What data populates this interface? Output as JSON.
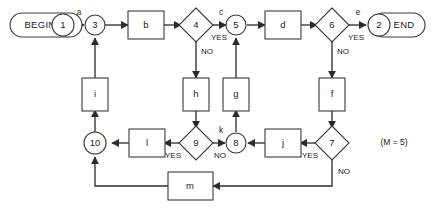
{
  "diagram": {
    "annotation": "(M = 5)",
    "terminators": [
      {
        "id": "begin",
        "label": "BEGIN",
        "node": "1"
      },
      {
        "id": "end",
        "label": "END",
        "node": "2"
      }
    ],
    "nodes": [
      {
        "id": "n1",
        "label": "1"
      },
      {
        "id": "n2",
        "label": "2"
      },
      {
        "id": "n3",
        "label": "3"
      },
      {
        "id": "n5",
        "label": "5"
      },
      {
        "id": "n8",
        "label": "8"
      },
      {
        "id": "n10",
        "label": "10"
      }
    ],
    "decisions": [
      {
        "id": "d4",
        "label": "4"
      },
      {
        "id": "d6",
        "label": "6"
      },
      {
        "id": "d7",
        "label": "7"
      },
      {
        "id": "d9",
        "label": "9"
      }
    ],
    "processes": [
      {
        "id": "pb",
        "label": "b"
      },
      {
        "id": "pd",
        "label": "d"
      },
      {
        "id": "pi",
        "label": "i"
      },
      {
        "id": "ph",
        "label": "h"
      },
      {
        "id": "pg",
        "label": "g"
      },
      {
        "id": "pf",
        "label": "f"
      },
      {
        "id": "pl",
        "label": "l"
      },
      {
        "id": "pj",
        "label": "j"
      },
      {
        "id": "pm",
        "label": "m"
      }
    ],
    "edge_labels": [
      {
        "id": "ea",
        "label": "a"
      },
      {
        "id": "ec",
        "label": "c"
      },
      {
        "id": "ee",
        "label": "e"
      },
      {
        "id": "ek",
        "label": "k"
      }
    ],
    "branch_labels": [
      {
        "id": "b4yes",
        "label": "YES"
      },
      {
        "id": "b4no",
        "label": "NO"
      },
      {
        "id": "b6yes",
        "label": "YES"
      },
      {
        "id": "b6no",
        "label": "NO"
      },
      {
        "id": "b7yes",
        "label": "YES"
      },
      {
        "id": "b7no",
        "label": "NO"
      },
      {
        "id": "b9yes",
        "label": "YES"
      },
      {
        "id": "b9no",
        "label": "NO"
      }
    ],
    "colors": {
      "background": "#ffffff",
      "stroke": "#3a3a3a",
      "edge": "#2b2b2b",
      "text": "#1a1a1a"
    }
  }
}
